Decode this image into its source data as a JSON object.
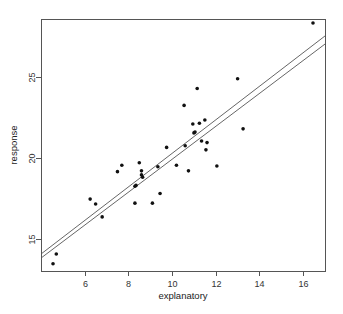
{
  "chart_data": {
    "type": "scatter",
    "title": "",
    "xlabel": "explanatory",
    "ylabel": "response",
    "xlim": [
      4.0,
      17.0
    ],
    "ylim": [
      13.0,
      28.6
    ],
    "xticks": [
      6,
      8,
      10,
      12,
      14,
      16
    ],
    "yticks": [
      15,
      20,
      25
    ],
    "grid": false,
    "legend": null,
    "points": [
      {
        "x": 4.55,
        "y": 13.45
      },
      {
        "x": 4.7,
        "y": 14.05
      },
      {
        "x": 6.25,
        "y": 17.45
      },
      {
        "x": 6.5,
        "y": 17.15
      },
      {
        "x": 6.8,
        "y": 16.35
      },
      {
        "x": 7.5,
        "y": 19.15
      },
      {
        "x": 7.7,
        "y": 19.55
      },
      {
        "x": 8.3,
        "y": 17.2
      },
      {
        "x": 8.3,
        "y": 18.25
      },
      {
        "x": 8.35,
        "y": 18.3
      },
      {
        "x": 8.5,
        "y": 19.7
      },
      {
        "x": 8.6,
        "y": 19.2
      },
      {
        "x": 8.6,
        "y": 18.95
      },
      {
        "x": 8.65,
        "y": 18.8
      },
      {
        "x": 9.1,
        "y": 17.2
      },
      {
        "x": 9.35,
        "y": 19.45
      },
      {
        "x": 9.45,
        "y": 17.8
      },
      {
        "x": 9.75,
        "y": 20.65
      },
      {
        "x": 10.2,
        "y": 19.55
      },
      {
        "x": 10.55,
        "y": 23.25
      },
      {
        "x": 10.6,
        "y": 20.75
      },
      {
        "x": 10.75,
        "y": 19.2
      },
      {
        "x": 10.95,
        "y": 22.1
      },
      {
        "x": 11.0,
        "y": 21.55
      },
      {
        "x": 11.05,
        "y": 21.6
      },
      {
        "x": 11.15,
        "y": 24.3
      },
      {
        "x": 11.25,
        "y": 22.15
      },
      {
        "x": 11.35,
        "y": 21.05
      },
      {
        "x": 11.5,
        "y": 22.35
      },
      {
        "x": 11.55,
        "y": 20.5
      },
      {
        "x": 11.6,
        "y": 20.95
      },
      {
        "x": 12.05,
        "y": 19.5
      },
      {
        "x": 13.0,
        "y": 24.9
      },
      {
        "x": 13.25,
        "y": 21.8
      },
      {
        "x": 16.45,
        "y": 28.35
      }
    ],
    "lines": [
      {
        "name": "fit-line-1",
        "x_start": 4.0,
        "y_start": 14.05,
        "x_end": 17.0,
        "y_end": 27.55
      },
      {
        "name": "fit-line-2",
        "x_start": 4.0,
        "y_start": 13.8,
        "x_end": 17.0,
        "y_end": 27.05
      }
    ]
  },
  "figure": {
    "background_color": "#ffffff",
    "point_color": "#111111",
    "line_color": "#555555",
    "frame_color": "#555555",
    "text_color": "#333333"
  }
}
